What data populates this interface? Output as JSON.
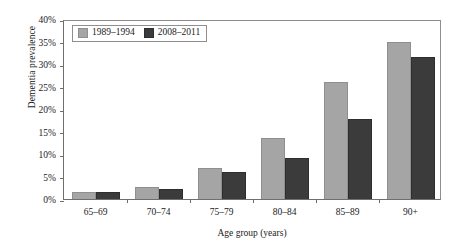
{
  "chart_data": {
    "type": "bar",
    "title": "",
    "xlabel": "Age group (years)",
    "ylabel": "Dementia prevalence",
    "categories": [
      "65–69",
      "70–74",
      "75–79",
      "80–84",
      "85–89",
      "90+"
    ],
    "series": [
      {
        "name": "1989–1994",
        "color": "#a5a5a5",
        "values": [
          1.6,
          2.6,
          7.0,
          13.6,
          26.0,
          34.8
        ]
      },
      {
        "name": "2008–2011",
        "color": "#3b3b3b",
        "values": [
          1.6,
          2.2,
          5.9,
          9.2,
          17.8,
          31.5
        ]
      }
    ],
    "ylim": [
      0,
      40
    ],
    "yticks": [
      0,
      5,
      10,
      15,
      20,
      25,
      30,
      35,
      40
    ],
    "ytick_labels": [
      "0%",
      "5%",
      "10%",
      "15%",
      "20%",
      "25%",
      "30%",
      "35%",
      "40%"
    ],
    "grid": false,
    "legend_position": "top-left",
    "value_unit": "%"
  }
}
